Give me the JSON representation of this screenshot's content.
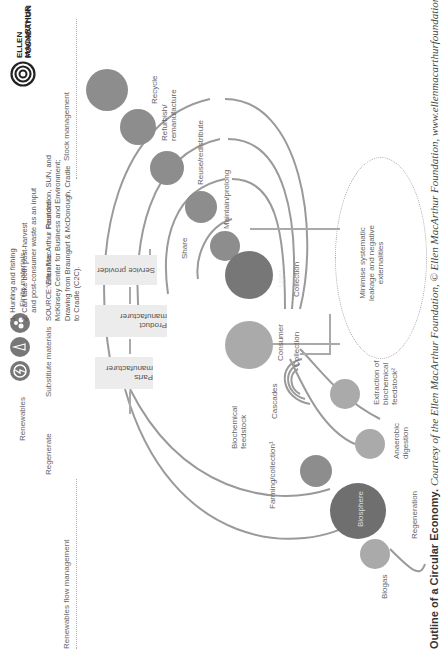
{
  "header": {
    "legend": {
      "renewables": "Renewables",
      "finite_materials": "Finite materials"
    },
    "principles": {
      "regenerate": "Regenerate",
      "substitute": "Substitute materials",
      "virtualise": "Virtualise",
      "restore": "Restore"
    },
    "left_section": "Renewables flow management",
    "right_section": "Stock management",
    "logo": {
      "line1": "ELLEN MACARTHUR",
      "line2": "FOUNDATION"
    }
  },
  "value_chain": [
    {
      "label": "Parts manufacturer"
    },
    {
      "label": "Product manufacturer"
    },
    {
      "label": "Service provider"
    }
  ],
  "biological_cycle": {
    "farming": "Farming/collection¹",
    "feedstock": "Biochemical\nfeedstock",
    "regeneration": "Regeneration",
    "biosphere": "Biosphere",
    "biogas": "Biogas",
    "anaerobic": "Anaerobic\ndigestion",
    "extraction": "Extraction of\nbiochemical\nfeedstock²",
    "cascades": "Cascades",
    "consumer": "Consumer",
    "collection": "Collection"
  },
  "technical_cycle": {
    "recycle": "Recycle",
    "refurbish": "Refurbish/\nremanufacture",
    "reuse": "Reuse/redistribute",
    "maintain": "Maintain/prolong",
    "share": "Share",
    "user": "User",
    "collection": "Collection"
  },
  "leakage": "Minimise systematic\nleakage and negative\nexternalities",
  "notes": {
    "n1": "1. Hunting and fishing",
    "n2": "2. Can take both post-harvest\n    and post-consumer waste as an input",
    "source": "SOURCE: Ellen MacArthur Foundation, SUN, and\nMcKinsey Center for Business and Environment;\nDrawing from Braungart & McDonough, Cradle\nto Cradle (C2C)."
  },
  "caption": {
    "title": "Outline of a Circular Economy.",
    "credit": "Courtesy of the Ellen MacArthur Foundation, © Ellen MacArthur Foundation, www.ellenmacarthurfoundation.org."
  },
  "colors": {
    "circle": "#8d8d8d",
    "arc": "#9a9a9a",
    "box": "#ececec",
    "text": "#555555"
  }
}
